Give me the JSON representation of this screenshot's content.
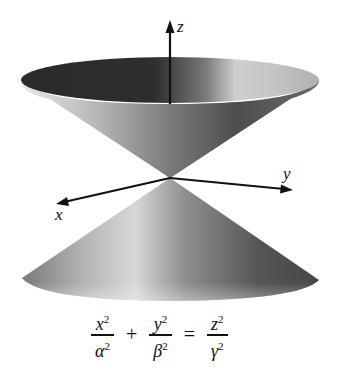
{
  "figure": {
    "type": "double-cone (elliptic cone surface)",
    "axes": {
      "z_label": "z",
      "y_label": "y",
      "x_label": "x"
    },
    "colors": {
      "background": "#ffffff",
      "axis": "#111111",
      "interior_dark": "#2f2f2f",
      "surface_light": "#d9d9d9",
      "surface_mid": "#8a8a8a",
      "surface_dark": "#4a4a4a"
    }
  },
  "equation": {
    "term1": {
      "num": "x",
      "num_exp": "2",
      "den": "α",
      "den_exp": "2"
    },
    "plus": "+",
    "term2": {
      "num": "y",
      "num_exp": "2",
      "den": "β",
      "den_exp": "2"
    },
    "equals": "=",
    "term3": {
      "num": "z",
      "num_exp": "2",
      "den": "γ",
      "den_exp": "2"
    }
  }
}
